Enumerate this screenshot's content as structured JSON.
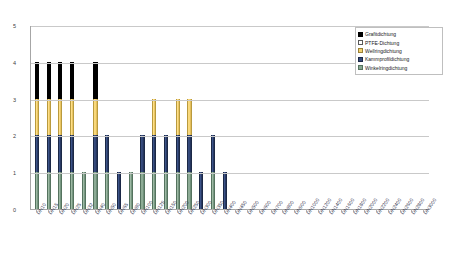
{
  "chart_data": {
    "type": "bar",
    "stacked": true,
    "title": "",
    "xlabel": "",
    "ylabel": "",
    "ylim": [
      0,
      5
    ],
    "yticks": [
      0,
      1,
      2,
      3,
      4,
      5
    ],
    "grid": true,
    "legend_position": "top-right",
    "categories": [
      "DN10",
      "DN15",
      "DN20",
      "DN25",
      "DN32",
      "DN40",
      "DN50",
      "DN65",
      "DN80",
      "DN100",
      "DN125",
      "DN150",
      "DN200",
      "DN250",
      "DN300",
      "DN350",
      "DN400",
      "DN450",
      "DN500",
      "DN600",
      "DN700",
      "DN800",
      "DN900",
      "DN1000",
      "DN1200",
      "DN1400",
      "DN1600",
      "DN1800",
      "DN2000",
      "DN2200",
      "DN2400",
      "DN2600",
      "DN2800",
      "DN3000"
    ],
    "series": [
      {
        "name": "Winkelringdichtung",
        "color": "#87a891",
        "values": [
          1,
          1,
          1,
          1,
          1,
          1,
          1,
          0,
          1,
          1,
          1,
          1,
          1,
          1,
          0,
          1,
          0,
          0,
          0,
          0,
          0,
          0,
          0,
          0,
          0,
          0,
          0,
          0,
          0,
          0,
          0,
          0,
          0,
          0
        ]
      },
      {
        "name": "Kammprofildichtung",
        "color": "#34497a",
        "values": [
          1,
          1,
          1,
          1,
          0,
          1,
          1,
          1,
          0,
          1,
          1,
          1,
          1,
          1,
          1,
          1,
          1,
          0,
          0,
          0,
          0,
          0,
          0,
          0,
          0,
          0,
          0,
          0,
          0,
          0,
          0,
          0,
          0,
          0
        ]
      },
      {
        "name": "Wellringdichtung",
        "color": "#f2d271",
        "values": [
          1,
          1,
          1,
          1,
          0,
          1,
          0,
          0,
          0,
          0,
          1,
          0,
          1,
          1,
          0,
          0,
          0,
          0,
          0,
          0,
          0,
          0,
          0,
          0,
          0,
          0,
          0,
          0,
          0,
          0,
          0,
          0,
          0,
          0
        ]
      },
      {
        "name": "PTFE-Dichtung",
        "color": "#ffffff",
        "values": [
          0,
          0,
          0,
          0,
          0,
          0,
          0,
          0,
          0,
          0,
          0,
          0,
          0,
          0,
          0,
          0,
          0,
          0,
          0,
          0,
          0,
          0,
          0,
          0,
          0,
          0,
          0,
          0,
          0,
          0,
          0,
          0,
          0,
          0
        ]
      },
      {
        "name": "Grafitdichtung",
        "color": "#000000",
        "values": [
          1,
          1,
          1,
          1,
          0,
          1,
          0,
          0,
          0,
          0,
          0,
          0,
          0,
          0,
          0,
          0,
          0,
          0,
          0,
          0,
          0,
          0,
          0,
          0,
          0,
          0,
          0,
          0,
          0,
          0,
          0,
          0,
          0,
          0
        ]
      }
    ],
    "totals": [
      4,
      4,
      4,
      4,
      1,
      4,
      2,
      1,
      1,
      2,
      3,
      2,
      3,
      3,
      1,
      2,
      1,
      0,
      1,
      0,
      0,
      0,
      0,
      0,
      0,
      0,
      0,
      0,
      0,
      0,
      0,
      0,
      0,
      0
    ]
  },
  "legend": {
    "items": [
      {
        "label": "Grafitdichtung",
        "key": "grafit"
      },
      {
        "label": "PTFE-Dichtung",
        "key": "ptfe"
      },
      {
        "label": "Wellringdichtung",
        "key": "wellring"
      },
      {
        "label": "Kammprofildichtung",
        "key": "kammprofil"
      },
      {
        "label": "Winkelringdichtung",
        "key": "winkelring"
      }
    ]
  }
}
